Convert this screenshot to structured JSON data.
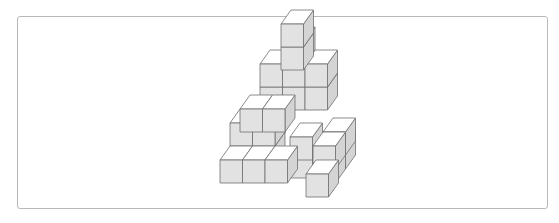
{
  "figure": {
    "cube": {
      "w": 22.5,
      "h": 23,
      "dx": 10,
      "dy": -14
    },
    "colors": {
      "top": "#ffffff",
      "front": "#e2e2e2",
      "side": "#d4d4d4",
      "edge": "#6e6e6e",
      "frame": "#b9b9b9"
    },
    "cubes": [
      {
        "x": 260,
        "y": 110
      },
      {
        "x": 282.5,
        "y": 110
      },
      {
        "x": 305,
        "y": 110
      },
      {
        "x": 260,
        "y": 87
      },
      {
        "x": 282.5,
        "y": 87
      },
      {
        "x": 305,
        "y": 87
      },
      {
        "x": 282.5,
        "y": 64
      },
      {
        "x": 281,
        "y": 70
      },
      {
        "x": 281,
        "y": 47
      },
      {
        "x": 230,
        "y": 169
      },
      {
        "x": 252.5,
        "y": 169
      },
      {
        "x": 230,
        "y": 146
      },
      {
        "x": 252.5,
        "y": 146
      },
      {
        "x": 240,
        "y": 132
      },
      {
        "x": 262.5,
        "y": 132
      },
      {
        "x": 290,
        "y": 178
      },
      {
        "x": 290,
        "y": 160
      },
      {
        "x": 323,
        "y": 169
      },
      {
        "x": 323,
        "y": 155
      },
      {
        "x": 313,
        "y": 183
      },
      {
        "x": 313,
        "y": 169
      },
      {
        "x": 220,
        "y": 183
      },
      {
        "x": 242.5,
        "y": 183
      },
      {
        "x": 265,
        "y": 183
      },
      {
        "x": 306,
        "y": 197
      }
    ]
  }
}
